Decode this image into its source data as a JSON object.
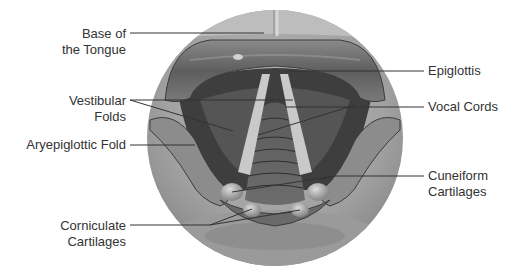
{
  "labels": {
    "base_of_tongue": "Base of\nthe Tongue",
    "vestibular_folds": "Vestibular\nFolds",
    "aryepiglottic_fold": "Aryepiglottic Fold",
    "corniculate_cartilages": "Corniculate\nCartilages",
    "epiglottis": "Epiglottis",
    "vocal_cords": "Vocal Cords",
    "cuneiform_cartilages": "Cuneiform\nCartilages"
  },
  "colors": {
    "background": "#ffffff",
    "circle_outer": "#8f8f8f",
    "circle_light": "#b4b4b4",
    "tissue_dark": "#4a4a4a",
    "tissue_mid": "#6e6e6e",
    "vocal_cord": "#c8c8c8",
    "leader_line": "#333333",
    "text": "#333333"
  }
}
